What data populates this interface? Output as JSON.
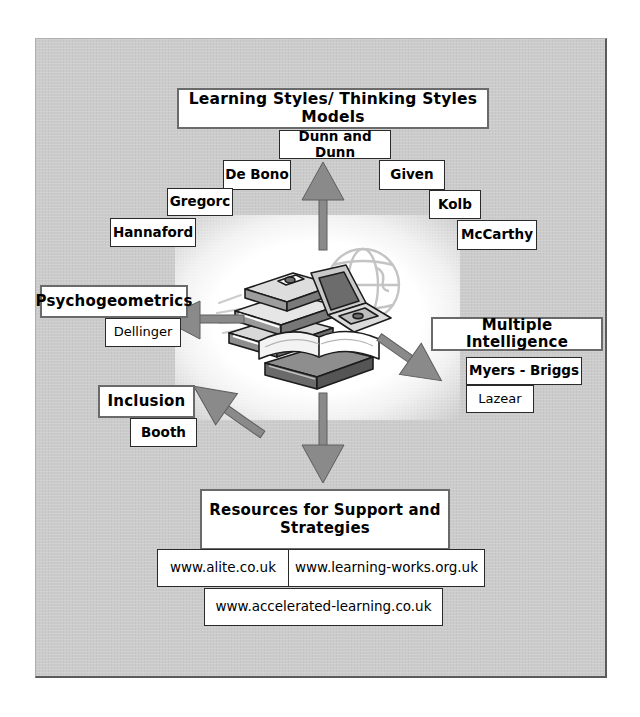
{
  "diagram": {
    "title": "Learning Styles/ Thinking Styles Models",
    "background_color": "#c9c9c9",
    "border_color": "#5b5b5b",
    "box_fill": "#ffffff",
    "arrow_color": "#808080",
    "arrow_outline": "#4a4a4a",
    "center_graphic": "books-computer-globe-clipart"
  },
  "top_cluster": {
    "heading": "Learning Styles/ Thinking Styles Models",
    "items": [
      {
        "label": "Dunn and Dunn"
      },
      {
        "label": "De Bono"
      },
      {
        "label": "Given"
      },
      {
        "label": "Gregorc"
      },
      {
        "label": "Kolb"
      },
      {
        "label": "Hannaford"
      },
      {
        "label": "McCarthy"
      }
    ]
  },
  "left_cluster_1": {
    "heading": "Psychogeometrics",
    "items": [
      {
        "label": "Dellinger"
      }
    ]
  },
  "left_cluster_2": {
    "heading": "Inclusion",
    "items": [
      {
        "label": "Booth"
      }
    ]
  },
  "right_cluster": {
    "heading": "Multiple Intelligence",
    "items": [
      {
        "label": "Myers - Briggs"
      },
      {
        "label": "Lazear"
      }
    ]
  },
  "bottom_cluster": {
    "heading_line1": "Resources for Support and",
    "heading_line2": "Strategies",
    "links": [
      {
        "label": "www.alite.co.uk"
      },
      {
        "label": "www.learning-works.org.uk"
      },
      {
        "label": "www.accelerated-learning.co.uk"
      }
    ]
  },
  "arrows": [
    {
      "name": "arrow-up",
      "direction": "up"
    },
    {
      "name": "arrow-down",
      "direction": "down"
    },
    {
      "name": "arrow-left",
      "direction": "left"
    },
    {
      "name": "arrow-down-left",
      "direction": "down-left"
    },
    {
      "name": "arrow-down-right",
      "direction": "down-right"
    }
  ]
}
